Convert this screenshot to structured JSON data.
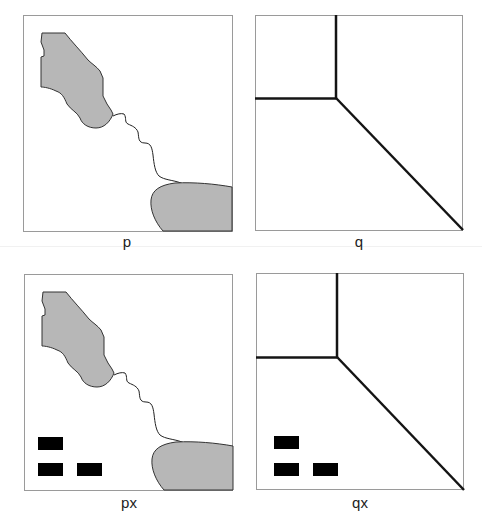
{
  "panels": [
    {
      "id": "p",
      "label": "p"
    },
    {
      "id": "q",
      "label": "q"
    },
    {
      "id": "px",
      "label": "px"
    },
    {
      "id": "qx",
      "label": "qx"
    }
  ],
  "colors": {
    "frame": "#9a9a9a",
    "region_fill": "#b7b7b7",
    "region_stroke": "#333333",
    "boundary_line": "#141414",
    "block_fill": "#000000"
  }
}
